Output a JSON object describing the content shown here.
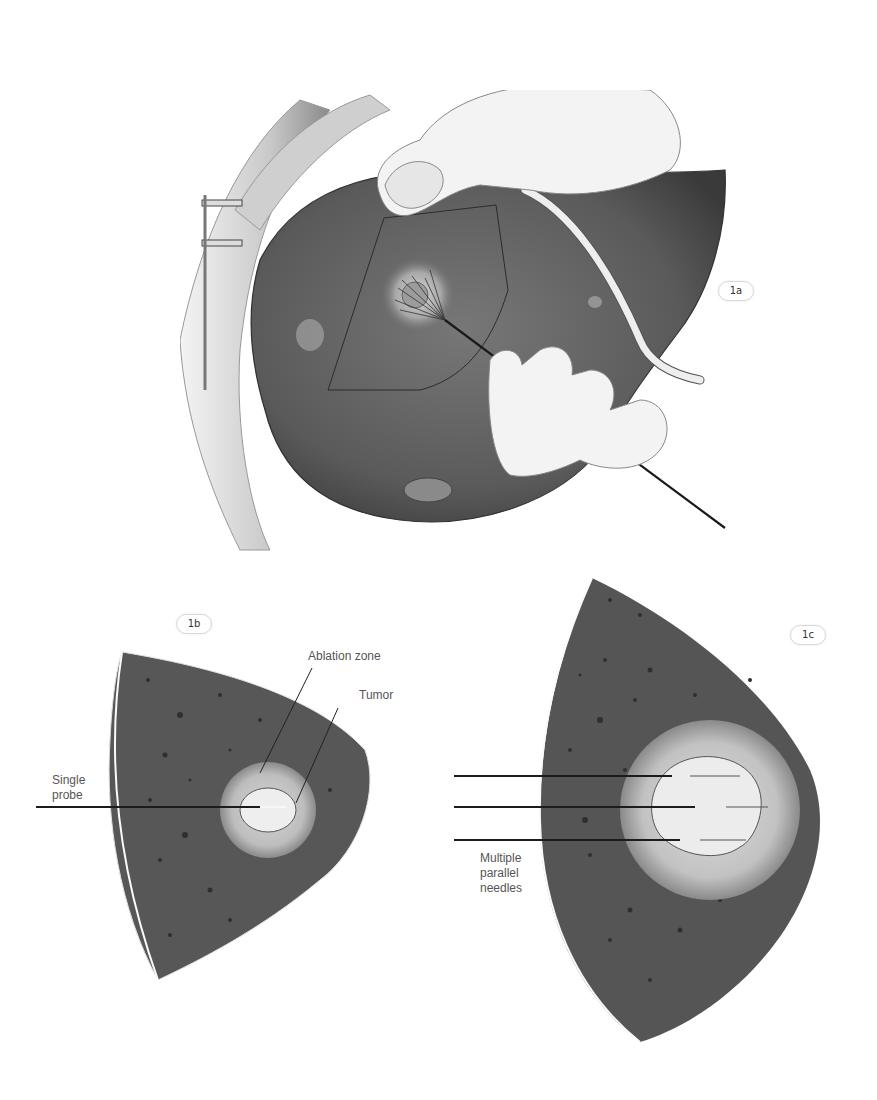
{
  "figure": {
    "panels": [
      {
        "id": "1a",
        "badge": "1a",
        "description": "Liver with ultrasound probe and multi-tine ablation probe inserted into tumor"
      },
      {
        "id": "1b",
        "badge": "1b",
        "description": "Ultrasound sector view: single probe ablation"
      },
      {
        "id": "1c",
        "badge": "1c",
        "description": "Ultrasound sector view: multiple parallel needles ablation"
      }
    ],
    "labels_1b": {
      "ablation_zone": "Ablation zone",
      "tumor": "Tumor",
      "single_probe_line1": "Single",
      "single_probe_line2": "probe"
    },
    "labels_1c": {
      "multiple_line1": "Multiple",
      "multiple_line2": "parallel",
      "multiple_line3": "needles"
    },
    "colors": {
      "liver": "#5c5c5c",
      "liver_dark": "#3f3f3f",
      "ablation_zone": "#bdbdbd",
      "tumor": "#eeeeee",
      "glove": "#f2f2f2",
      "line": "#222222",
      "label_text": "#555555"
    }
  }
}
